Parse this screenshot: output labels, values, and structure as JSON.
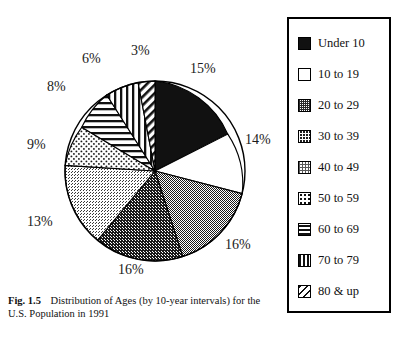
{
  "figure": {
    "number_label": "Fig. 1.5",
    "caption": "Distribution of Ages (by 10-year intervals) for the U.S. Population in 1991"
  },
  "chart_data": {
    "type": "pie",
    "title": "Distribution of Ages (by 10-year intervals) for the U.S. Population in 1991",
    "xlabel": "",
    "ylabel": "",
    "units": "percent",
    "start_angle_deg": 0,
    "direction": "clockwise",
    "legend_position": "right",
    "grid": false,
    "categories": [
      "Under 10",
      "10 to 19",
      "20 to 29",
      "30 to 39",
      "40 to 49",
      "50 to 59",
      "60 to 69",
      "70 to 79",
      "80 & up"
    ],
    "values": [
      15,
      14,
      16,
      16,
      13,
      9,
      8,
      6,
      3
    ],
    "labels": [
      "15%",
      "14%",
      "16%",
      "16%",
      "13%",
      "9%",
      "8%",
      "6%",
      "3%"
    ],
    "fills": [
      "solid-black",
      "white",
      "medium-gray-dots",
      "dark-gray-dots",
      "light-gray-dots",
      "sparse-dots",
      "horizontal-lines",
      "vertical-lines",
      "diagonal-lines"
    ],
    "colors": {
      "outline": "#000000",
      "solid_black": "#111111",
      "white": "#ffffff",
      "medium_gray": "#9a9a9a",
      "dark_gray": "#6a6a6a",
      "light_gray": "#c9c9c9"
    }
  },
  "legend": {
    "items": [
      {
        "label": "Under 10",
        "fill": "solid-black"
      },
      {
        "label": "10 to 19",
        "fill": "white"
      },
      {
        "label": "20 to 29",
        "fill": "medium-gray-dots"
      },
      {
        "label": "30 to 39",
        "fill": "dark-gray-dots"
      },
      {
        "label": "40 to 49",
        "fill": "light-gray-dots"
      },
      {
        "label": "50 to 59",
        "fill": "sparse-dots"
      },
      {
        "label": "60 to 69",
        "fill": "horizontal-lines"
      },
      {
        "label": "70 to 79",
        "fill": "vertical-lines"
      },
      {
        "label": "80 & up",
        "fill": "diagonal-lines"
      }
    ]
  },
  "pie_labels": [
    {
      "text": "15%",
      "left": 190,
      "top": 62
    },
    {
      "text": "14%",
      "left": 245,
      "top": 133
    },
    {
      "text": "16%",
      "left": 225,
      "top": 238
    },
    {
      "text": "16%",
      "left": 118,
      "top": 263
    },
    {
      "text": "13%",
      "left": 27,
      "top": 215
    },
    {
      "text": "9%",
      "left": 27,
      "top": 138
    },
    {
      "text": "8%",
      "left": 47,
      "top": 80
    },
    {
      "text": "6%",
      "left": 82,
      "top": 52
    },
    {
      "text": "3%",
      "left": 131,
      "top": 44
    }
  ]
}
